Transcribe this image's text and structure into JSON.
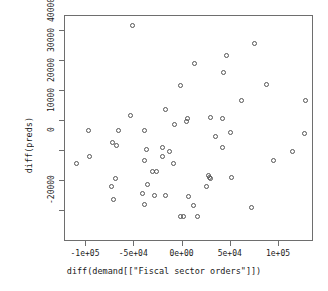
{
  "chart_data": {
    "type": "scatter",
    "title": "",
    "xlabel": "diff(demand[[\"Fiscal sector orders\"]])",
    "ylabel": "diff(preds)",
    "xlim": [
      -115000,
      135000
    ],
    "ylim": [
      -27000,
      45000
    ],
    "xticks": [
      -100000,
      -50000,
      0,
      50000,
      100000
    ],
    "xticklabels": [
      "-1e+05",
      "-5e+04",
      "0e+00",
      "5e+04",
      "1e+05"
    ],
    "yticks": [
      -20000,
      -10000,
      0,
      10000,
      20000,
      30000,
      40000
    ],
    "yticklabels": [
      "-20000",
      "",
      "0",
      "10000",
      "20000",
      "30000",
      "40000"
    ],
    "grid": false,
    "legend": false,
    "marker": "open-circle",
    "marker_color": "#555555",
    "points": [
      {
        "x": -51500,
        "y": 41700
      },
      {
        "x": 75000,
        "y": 35700
      },
      {
        "x": 45500,
        "y": 31700
      },
      {
        "x": 12500,
        "y": 29300
      },
      {
        "x": 43000,
        "y": 26300
      },
      {
        "x": 87000,
        "y": 22300
      },
      {
        "x": -2000,
        "y": 21700
      },
      {
        "x": 61000,
        "y": 17000
      },
      {
        "x": 127000,
        "y": 17000
      },
      {
        "x": -17500,
        "y": 13700
      },
      {
        "x": -53500,
        "y": 11700
      },
      {
        "x": 5000,
        "y": 11000
      },
      {
        "x": 29500,
        "y": 11300
      },
      {
        "x": 41000,
        "y": 11000
      },
      {
        "x": 4000,
        "y": 10000
      },
      {
        "x": -8500,
        "y": 8700
      },
      {
        "x": -97500,
        "y": 6700
      },
      {
        "x": -66500,
        "y": 7000
      },
      {
        "x": -39500,
        "y": 7000
      },
      {
        "x": 50000,
        "y": 6300
      },
      {
        "x": 126000,
        "y": 5700
      },
      {
        "x": 34500,
        "y": 4700
      },
      {
        "x": -72500,
        "y": 2700
      },
      {
        "x": -68500,
        "y": 1700
      },
      {
        "x": -20500,
        "y": 1300
      },
      {
        "x": 41500,
        "y": 1300
      },
      {
        "x": -37500,
        "y": 500
      },
      {
        "x": -13500,
        "y": -300
      },
      {
        "x": 114000,
        "y": -300
      },
      {
        "x": -20500,
        "y": -1700
      },
      {
        "x": -96500,
        "y": -1700
      },
      {
        "x": 94000,
        "y": -3300
      },
      {
        "x": -109500,
        "y": -4000
      },
      {
        "x": -39500,
        "y": -3300
      },
      {
        "x": -9500,
        "y": -4000
      },
      {
        "x": -31500,
        "y": -6700
      },
      {
        "x": -26500,
        "y": -6700
      },
      {
        "x": 27000,
        "y": -8300
      },
      {
        "x": 28000,
        "y": -8700
      },
      {
        "x": 28500,
        "y": -9300
      },
      {
        "x": 51000,
        "y": -8700
      },
      {
        "x": -69500,
        "y": -9000
      },
      {
        "x": -73500,
        "y": -11700
      },
      {
        "x": -36500,
        "y": -11300
      },
      {
        "x": 24500,
        "y": -11700
      },
      {
        "x": -41500,
        "y": -14300
      },
      {
        "x": -29500,
        "y": -14700
      },
      {
        "x": -17500,
        "y": -14700
      },
      {
        "x": 6500,
        "y": -15000
      },
      {
        "x": -72000,
        "y": -16300
      },
      {
        "x": -39000,
        "y": -17700
      },
      {
        "x": 11500,
        "y": -18000
      },
      {
        "x": 71000,
        "y": -18700
      },
      {
        "x": -2500,
        "y": -21700
      },
      {
        "x": 1000,
        "y": -21700
      },
      {
        "x": 15500,
        "y": -21700
      }
    ]
  },
  "axis": {
    "x_label": "diff(demand[[\"Fiscal sector orders\"]])",
    "y_label": "diff(preds)"
  }
}
